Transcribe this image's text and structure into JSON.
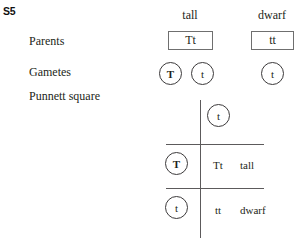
{
  "figure": {
    "id_label": "S5"
  },
  "row_labels": {
    "parents": "Parents",
    "gametes": "Gametes",
    "punnett": "Punnett square"
  },
  "columns": [
    {
      "heading": "tall"
    },
    {
      "heading": "dwarf"
    }
  ],
  "parents": [
    {
      "phenotype": "tall",
      "genotype": "Tt"
    },
    {
      "phenotype": "dwarf",
      "genotype": "tt"
    }
  ],
  "gametes": {
    "tall_parent": [
      {
        "allele": "T"
      },
      {
        "allele": "t"
      }
    ],
    "dwarf_parent": [
      {
        "allele": "t"
      }
    ]
  },
  "punnett_square": {
    "top_gamete": {
      "allele": "t"
    },
    "left_gametes": [
      {
        "allele": "T"
      },
      {
        "allele": "t"
      }
    ],
    "offspring": [
      {
        "genotype": "Tt",
        "phenotype": "tall"
      },
      {
        "genotype": "tt",
        "phenotype": "dwarf"
      }
    ]
  },
  "colors": {
    "text": "#231f20",
    "line": "#5c5a5b",
    "box_border": "#6f6f6f",
    "circle_border": "#3c3a3b",
    "background": "#ffffff"
  }
}
